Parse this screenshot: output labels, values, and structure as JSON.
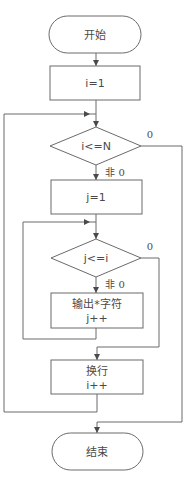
{
  "flowchart": {
    "start": {
      "label": "开始"
    },
    "init_i": {
      "label": "i=1"
    },
    "cond_outer": {
      "label": "i<=N",
      "true_label": "非 0",
      "false_label": "0"
    },
    "init_j": {
      "label": "j=1"
    },
    "cond_inner": {
      "label": "j<=i",
      "true_label": "非 0",
      "false_label": "0"
    },
    "print_star": {
      "line1": "输出*字符",
      "line2": "j++"
    },
    "newline": {
      "line1": "换行",
      "line2": "i++"
    },
    "end": {
      "label": "结束"
    }
  },
  "colors": {
    "line": "#6a6a6a",
    "text": "#4a4a4a",
    "background": "#ffffff"
  }
}
